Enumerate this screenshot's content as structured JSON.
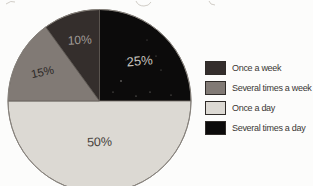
{
  "canvas": {
    "width": 313,
    "height": 186,
    "background": "#fcfcfb"
  },
  "chart_data": {
    "type": "pie",
    "title": "",
    "legend_position": "right",
    "categories": [
      "Once a week",
      "Several times a week",
      "Once a day",
      "Several times a day"
    ],
    "values": [
      10,
      15,
      50,
      25
    ],
    "pie": {
      "cx": 99.5,
      "cy": 101,
      "r": 91.5,
      "edge_color": "#5f5953",
      "rim_color": "#87827c"
    },
    "slices": [
      {
        "label": "Several times a day",
        "value": 25,
        "pct_text": "25%",
        "color": "#0c0b0b",
        "label_color": "#c6c2be",
        "label_r_frac": 0.62,
        "label_tilt": -5,
        "label_size": 13
      },
      {
        "label": "Once a day",
        "value": 50,
        "pct_text": "50%",
        "color": "#dcd9d3",
        "label_color": "#47423c",
        "label_r_frac": 0.45,
        "label_tilt": -2,
        "label_size": 12.5
      },
      {
        "label": "Several times a week",
        "value": 15,
        "pct_text": "15%",
        "color": "#817a75",
        "label_color": "#2b2725",
        "label_r_frac": 0.7,
        "label_tilt": -12,
        "label_size": 11.5
      },
      {
        "label": "Once a week",
        "value": 10,
        "pct_text": "10%",
        "color": "#342e2c",
        "label_color": "#a19d99",
        "label_r_frac": 0.7,
        "label_tilt": -3,
        "label_size": 12
      }
    ]
  },
  "legend": {
    "items": [
      {
        "label": "Once a week",
        "color": "#342e2c"
      },
      {
        "label": "Several times a week",
        "color": "#817a75"
      },
      {
        "label": "Once a day",
        "color": "#dcd9d3"
      },
      {
        "label": "Several times a day",
        "color": "#0c0b0b"
      }
    ]
  }
}
